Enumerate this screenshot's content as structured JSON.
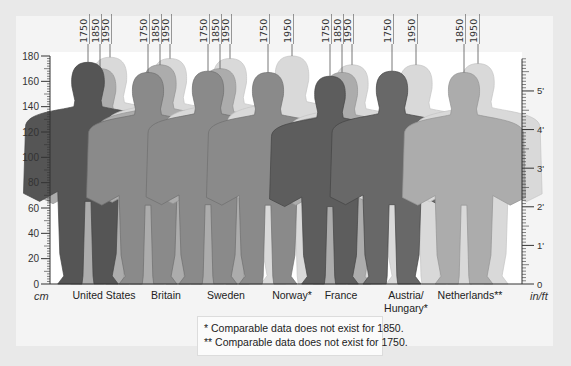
{
  "chart_data": {
    "type": "bar",
    "title": "",
    "xlabel": "",
    "ylabel_left": "cm",
    "ylabel_right": "in/ft",
    "ylim": [
      0,
      180
    ],
    "left_ticks": [
      "0",
      "20",
      "40",
      "60",
      "80",
      "100",
      "120",
      "140",
      "160",
      "180"
    ],
    "right_ticks": [
      "0",
      "1'",
      "2'",
      "3'",
      "4'",
      "5'"
    ],
    "categories": [
      "United States",
      "Britain",
      "Sweden",
      "Norway*",
      "France",
      "Austria/ Hungary*",
      "Netherlands**"
    ],
    "series": [
      {
        "name": "1750",
        "values": [
          175,
          167,
          168,
          167,
          164,
          168,
          null
        ]
      },
      {
        "name": "1850",
        "values": [
          170,
          173,
          170,
          null,
          167,
          null,
          167
        ]
      },
      {
        "name": "1950",
        "values": [
          179,
          178,
          178,
          180,
          173,
          173,
          174
        ]
      }
    ],
    "legend": "Year labels on leader lines above each figure",
    "grid": false,
    "annotations": [
      "* Comparable data does not exist for 1850.",
      "** Comparable data does not exist for 1750."
    ]
  },
  "axis": {
    "left_unit": "cm",
    "right_unit": "in/ft"
  },
  "countries": [
    {
      "label": "United States",
      "years": [
        "1750",
        "1850",
        "1950"
      ]
    },
    {
      "label": "Britain",
      "years": [
        "1750",
        "1850",
        "1950"
      ]
    },
    {
      "label": "Sweden",
      "years": [
        "1750",
        "1850",
        "1950"
      ]
    },
    {
      "label": "Norway*",
      "years": [
        "1750",
        "1950"
      ]
    },
    {
      "label": "France",
      "years": [
        "1750",
        "1850",
        "1950"
      ]
    },
    {
      "label": "Austria/",
      "label2": "Hungary*",
      "years": [
        "1750",
        "1950"
      ]
    },
    {
      "label": "Netherlands**",
      "years": [
        "1850",
        "1950"
      ]
    }
  ],
  "footnotes": {
    "one": "* Comparable data does not exist for 1850.",
    "two": "** Comparable data does not exist for 1750."
  },
  "colors": {
    "c1750_dark": "#5c5c5c",
    "c1750": "#8a8a8a",
    "c1850": "#a8a8a8",
    "c1950": "#d6d6d6"
  }
}
